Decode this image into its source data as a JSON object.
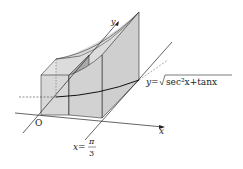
{
  "diagram": {
    "labels": {
      "origin": "O",
      "x_axis": "x",
      "y_axis": "y",
      "curve_lhs": "y=",
      "curve_rhs": "sec²x+tanx",
      "bound_lhs": "x=",
      "bound_num": "π",
      "bound_den": "3"
    },
    "colors": {
      "stroke": "#222222",
      "face_light": "#d9d9d9",
      "face_mid": "#c8c8c8",
      "face_dark": "#a8a8a8",
      "dashed": "#444444"
    }
  }
}
